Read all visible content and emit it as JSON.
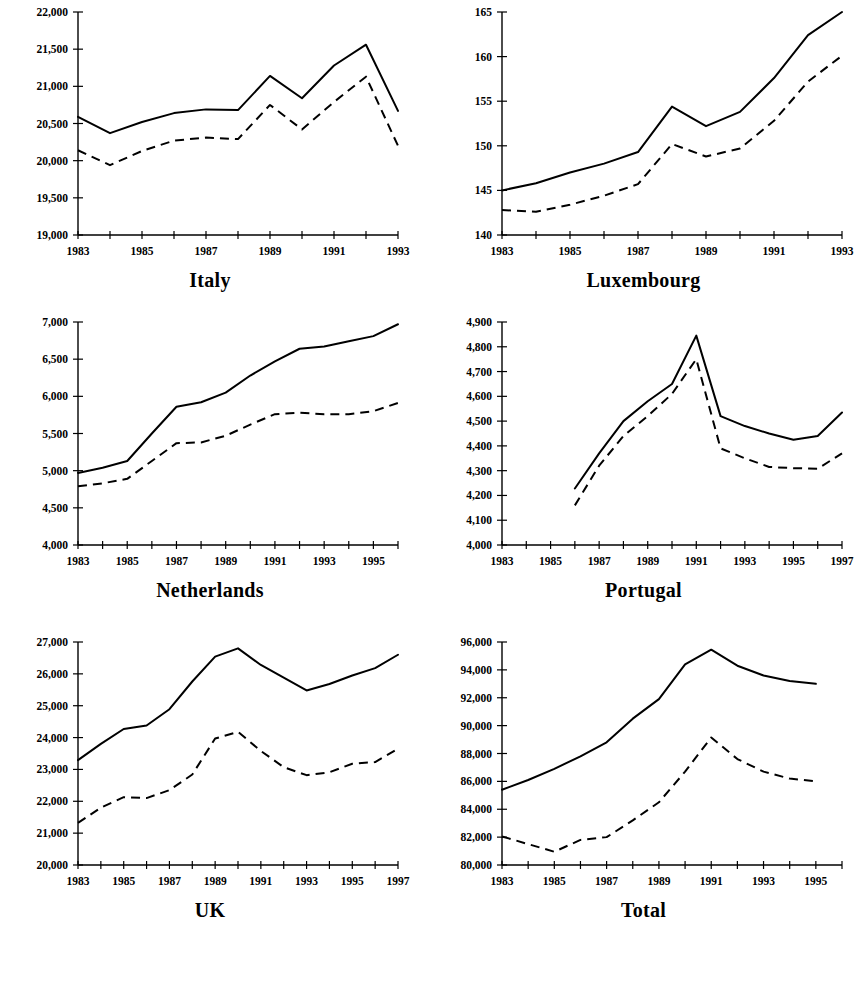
{
  "figure": {
    "layout": "2 columns x 3 rows small multiples",
    "background_color": "#ffffff",
    "line_color": "#000000"
  },
  "chart_data": [
    {
      "type": "line",
      "title": "Italy",
      "xlabel": "",
      "ylabel": "",
      "grid": false,
      "legend": "none",
      "x": [
        1983,
        1984,
        1985,
        1986,
        1987,
        1988,
        1989,
        1990,
        1991,
        1992,
        1993
      ],
      "xlim": [
        1983,
        1993
      ],
      "xticks": [
        1983,
        1984,
        1985,
        1986,
        1987,
        1988,
        1989,
        1990,
        1991,
        1992,
        1993
      ],
      "xtick_labels": [
        "1983",
        "",
        "1985",
        "",
        "1987",
        "",
        "1989",
        "",
        "1991",
        "",
        "1993"
      ],
      "ylim": [
        19000,
        22000
      ],
      "yticks": [
        19000,
        19500,
        20000,
        20500,
        21000,
        21500,
        22000
      ],
      "ytick_labels": [
        "19,000",
        "19,500",
        "20,000",
        "20,500",
        "21,000",
        "21,500",
        "22,000"
      ],
      "series": [
        {
          "name": "solid",
          "style": "solid",
          "values": [
            20590,
            20370,
            20520,
            20640,
            20690,
            20680,
            21140,
            20840,
            21280,
            21560,
            20670,
            20370
          ]
        },
        {
          "name": "dashed",
          "style": "dashed",
          "values": [
            20140,
            19940,
            20130,
            20270,
            20310,
            20290,
            20750,
            20420,
            20790,
            21130,
            20200,
            19980
          ]
        }
      ]
    },
    {
      "type": "line",
      "title": "Luxembourg",
      "xlabel": "",
      "ylabel": "",
      "grid": false,
      "legend": "none",
      "x": [
        1983,
        1984,
        1985,
        1986,
        1987,
        1988,
        1989,
        1990,
        1991,
        1992,
        1993
      ],
      "xlim": [
        1983,
        1993
      ],
      "xticks": [
        1983,
        1984,
        1985,
        1986,
        1987,
        1988,
        1989,
        1990,
        1991,
        1992,
        1993
      ],
      "xtick_labels": [
        "1983",
        "",
        "1985",
        "",
        "1987",
        "",
        "1989",
        "",
        "1991",
        "",
        "1993"
      ],
      "ylim": [
        140,
        165
      ],
      "yticks": [
        140,
        145,
        150,
        155,
        160,
        165
      ],
      "ytick_labels": [
        "140",
        "145",
        "150",
        "155",
        "160",
        "165"
      ],
      "series": [
        {
          "name": "solid",
          "style": "solid",
          "values": [
            145.0,
            145.8,
            147.0,
            148.0,
            149.3,
            154.4,
            152.2,
            153.8,
            157.6,
            162.4,
            165.0,
            165.0
          ]
        },
        {
          "name": "dashed",
          "style": "dashed",
          "values": [
            142.8,
            142.6,
            143.4,
            144.4,
            145.7,
            150.2,
            148.8,
            149.7,
            152.8,
            157.2,
            160.1,
            160.0
          ]
        }
      ]
    },
    {
      "type": "line",
      "title": "Netherlands",
      "xlabel": "",
      "ylabel": "",
      "grid": false,
      "legend": "none",
      "x": [
        1983,
        1984,
        1985,
        1986,
        1987,
        1988,
        1989,
        1990,
        1991,
        1992,
        1993,
        1994,
        1995,
        1996
      ],
      "xlim": [
        1983,
        1996
      ],
      "xticks": [
        1983,
        1984,
        1985,
        1986,
        1987,
        1988,
        1989,
        1990,
        1991,
        1992,
        1993,
        1994,
        1995,
        1996
      ],
      "xtick_labels": [
        "1983",
        "",
        "1985",
        "",
        "1987",
        "",
        "1989",
        "",
        "1991",
        "",
        "1993",
        "",
        "1995",
        ""
      ],
      "ylim": [
        4000,
        7000
      ],
      "yticks": [
        4000,
        4500,
        5000,
        5500,
        6000,
        6500,
        7000
      ],
      "ytick_labels": [
        "4,000",
        "4,500",
        "5,000",
        "5,500",
        "6,000",
        "6,500",
        "7,000"
      ],
      "series": [
        {
          "name": "solid",
          "style": "solid",
          "values": [
            4970,
            5040,
            5130,
            5500,
            5860,
            5920,
            6050,
            6280,
            6470,
            6640,
            6670,
            6740,
            6810,
            6970
          ]
        },
        {
          "name": "dashed",
          "style": "dashed",
          "values": [
            4790,
            4830,
            4890,
            5130,
            5370,
            5380,
            5470,
            5620,
            5760,
            5780,
            5760,
            5760,
            5800,
            5910
          ]
        }
      ]
    },
    {
      "type": "line",
      "title": "Portugal",
      "xlabel": "",
      "ylabel": "",
      "grid": false,
      "legend": "none",
      "x": [
        1986,
        1987,
        1988,
        1989,
        1990,
        1991,
        1992,
        1993,
        1994,
        1995,
        1996,
        1997
      ],
      "xlim": [
        1983,
        1997
      ],
      "xticks": [
        1983,
        1984,
        1985,
        1986,
        1987,
        1988,
        1989,
        1990,
        1991,
        1992,
        1993,
        1994,
        1995,
        1996,
        1997
      ],
      "xtick_labels": [
        "1983",
        "",
        "1985",
        "",
        "1987",
        "",
        "1989",
        "",
        "1991",
        "",
        "1993",
        "",
        "1995",
        "",
        "1997"
      ],
      "ylim": [
        4000,
        4900
      ],
      "yticks": [
        4000,
        4100,
        4200,
        4300,
        4400,
        4500,
        4600,
        4700,
        4800,
        4900
      ],
      "ytick_labels": [
        "4,000",
        "4,100",
        "4,200",
        "4,300",
        "4,400",
        "4,500",
        "4,600",
        "4,700",
        "4,800",
        "4,900"
      ],
      "series": [
        {
          "name": "solid",
          "style": "solid",
          "values": [
            4228,
            4370,
            4500,
            4580,
            4650,
            4845,
            4520,
            4480,
            4450,
            4425,
            4440,
            4535
          ]
        },
        {
          "name": "dashed",
          "style": "dashed",
          "values": [
            4160,
            4320,
            4440,
            4520,
            4610,
            4750,
            4390,
            4350,
            4315,
            4310,
            4308,
            4370
          ]
        }
      ]
    },
    {
      "type": "line",
      "title": "UK",
      "xlabel": "",
      "ylabel": "",
      "grid": false,
      "legend": "none",
      "x": [
        1983,
        1984,
        1985,
        1986,
        1987,
        1988,
        1989,
        1990,
        1991,
        1992,
        1993,
        1994,
        1995,
        1996,
        1997
      ],
      "xlim": [
        1983,
        1997
      ],
      "xticks": [
        1983,
        1984,
        1985,
        1986,
        1987,
        1988,
        1989,
        1990,
        1991,
        1992,
        1993,
        1994,
        1995,
        1996,
        1997
      ],
      "xtick_labels": [
        "1983",
        "",
        "1985",
        "",
        "1987",
        "",
        "1989",
        "",
        "1991",
        "",
        "1993",
        "",
        "1995",
        "",
        "1997"
      ],
      "ylim": [
        20000,
        27000
      ],
      "yticks": [
        20000,
        21000,
        22000,
        23000,
        24000,
        25000,
        26000,
        27000
      ],
      "ytick_labels": [
        "20,000",
        "21,000",
        "22,000",
        "23,000",
        "24,000",
        "25,000",
        "26,000",
        "27,000"
      ],
      "series": [
        {
          "name": "solid",
          "style": "solid",
          "values": [
            23290,
            23800,
            24270,
            24380,
            24890,
            25760,
            26540,
            26800,
            26280,
            25880,
            25480,
            25680,
            25950,
            26180,
            26600
          ]
        },
        {
          "name": "dashed",
          "style": "dashed",
          "values": [
            21320,
            21800,
            22130,
            22100,
            22350,
            22840,
            23970,
            24180,
            23580,
            23070,
            22820,
            22910,
            23180,
            23230,
            23650
          ]
        }
      ]
    },
    {
      "type": "line",
      "title": "Total",
      "xlabel": "",
      "ylabel": "",
      "grid": false,
      "legend": "none",
      "x": [
        1983,
        1984,
        1985,
        1986,
        1987,
        1988,
        1989,
        1990,
        1991,
        1992,
        1993,
        1994,
        1995
      ],
      "xlim": [
        1983,
        1996
      ],
      "xticks": [
        1983,
        1984,
        1985,
        1986,
        1987,
        1988,
        1989,
        1990,
        1991,
        1992,
        1993,
        1994,
        1995,
        1996
      ],
      "xtick_labels": [
        "1983",
        "",
        "1985",
        "",
        "1987",
        "",
        "1989",
        "",
        "1991",
        "",
        "1993",
        "",
        "1995",
        ""
      ],
      "ylim": [
        80000,
        96000
      ],
      "yticks": [
        80000,
        82000,
        84000,
        86000,
        88000,
        90000,
        92000,
        94000,
        96000
      ],
      "ytick_labels": [
        "80,000",
        "82,000",
        "84,000",
        "86,000",
        "88,000",
        "90,000",
        "92,000",
        "94,000",
        "96,000"
      ],
      "series": [
        {
          "name": "solid",
          "style": "solid",
          "values": [
            85400,
            86100,
            86900,
            87800,
            88800,
            90500,
            91900,
            94400,
            95450,
            94300,
            93600,
            93200,
            93000,
            93300
          ]
        },
        {
          "name": "dashed",
          "style": "dashed",
          "values": [
            82050,
            81500,
            80950,
            81800,
            82000,
            83200,
            84500,
            86700,
            89150,
            87600,
            86700,
            86200,
            86000,
            86050
          ]
        }
      ]
    }
  ]
}
